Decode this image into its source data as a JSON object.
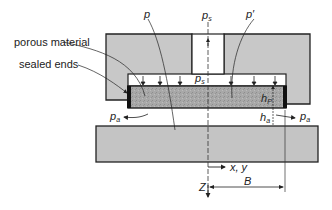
{
  "diagram": {
    "labels": {
      "porous_material": "porous material",
      "sealed_ends": "sealed ends",
      "p": "p",
      "p_prime": "p′",
      "p_s_top": {
        "base": "p",
        "sub": "s"
      },
      "p_s_inner": {
        "base": "p",
        "sub": "s"
      },
      "h_p": {
        "base": "h",
        "sub": "P"
      },
      "h_a": {
        "base": "h",
        "sub": "a"
      },
      "p_a_left": {
        "base": "p",
        "sub": "a"
      },
      "p_a_right": {
        "base": "p",
        "sub": "a"
      },
      "xy_axis": "x, y",
      "z_axis": "Z",
      "width_dim": "B"
    },
    "colors": {
      "housing_fill": "#c8c8c8",
      "porous_fill": "#a9a9a9",
      "plate_fill": "#c4c4c4",
      "stroke": "#222222",
      "background": "#ffffff"
    }
  }
}
